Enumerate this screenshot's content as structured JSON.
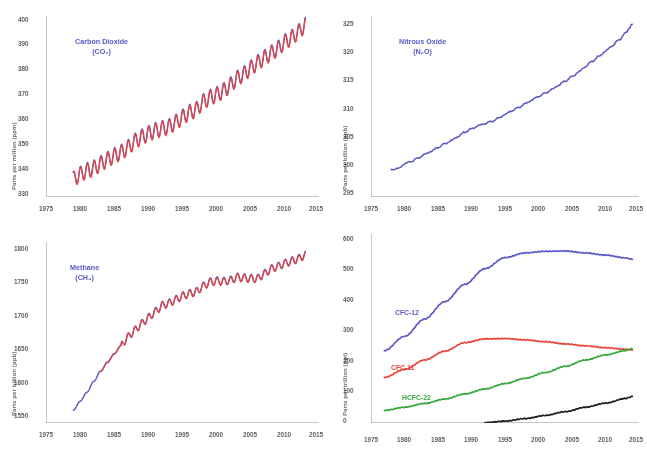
{
  "figure": {
    "panel_count": 4
  },
  "panels": {
    "co2": {
      "label": "Carbon Dioxide",
      "formula": "(CO₂)",
      "ylabel": "Parts per million (ppm)",
      "yticks": [
        "400",
        "390",
        "380",
        "370",
        "360",
        "350",
        "340",
        "330"
      ],
      "xticks": [
        "1975",
        "1980",
        "1985",
        "1990",
        "1995",
        "2000",
        "2005",
        "2010",
        "2015"
      ]
    },
    "n2o": {
      "label": "Nitrous Oxide",
      "formula": "(N₂O)",
      "ylabel": "Parts per billion (ppb)",
      "yticks": [
        "325",
        "320",
        "315",
        "310",
        "305",
        "300",
        "295"
      ],
      "xticks": [
        "1975",
        "1980",
        "1985",
        "1990",
        "1995",
        "2000",
        "2005",
        "2010",
        "2015"
      ]
    },
    "ch4": {
      "label": "Methane",
      "formula": "(CH₄)",
      "ylabel": "Parts per billion (ppb)",
      "yticks": [
        "1800",
        "1750",
        "1700",
        "1650",
        "1600",
        "1550"
      ],
      "xticks": [
        "1975",
        "1980",
        "1985",
        "1990",
        "1995",
        "2000",
        "2005",
        "2010",
        "2015"
      ]
    },
    "halocarbons": {
      "ylabel": "Parts per trillion (ppt)",
      "yticks": [
        "600",
        "500",
        "400",
        "300",
        "200",
        "100",
        "0"
      ],
      "xticks": [
        "1975",
        "1980",
        "1985",
        "1990",
        "1995",
        "2000",
        "2005",
        "2010",
        "2015"
      ],
      "series_labels": {
        "cfc12": "CFC-12",
        "cfc11": "CFC-11",
        "hcfc22": "HCFC-22",
        "hfc134a": "HFC-134a"
      }
    }
  },
  "colors": {
    "blue": "#5b58c8",
    "red": "#e8443a",
    "green": "#36a83a",
    "black": "#1d1d1d",
    "axis": "#9a9a9a",
    "tick_text": "#353535"
  },
  "chart_data": [
    {
      "type": "line",
      "id": "co2",
      "title": "Carbon Dioxide (CO2)",
      "xlabel": "",
      "ylabel": "Parts per million (ppm)",
      "xlim": [
        1975,
        2015
      ],
      "ylim": [
        330,
        400
      ],
      "grid": false,
      "legend": "none",
      "annotation": "Carbon Dioxide (CO₂)",
      "note": "Two overlapping traces (blue and red) showing monthly mean CO2 with a seasonal sawtooth cycle superimposed on a rising trend.",
      "series": [
        {
          "name": "CO2 (blue trace)",
          "color": "#5b58c8",
          "x": [
            1979,
            1980,
            1981,
            1982,
            1983,
            1984,
            1985,
            1986,
            1987,
            1988,
            1989,
            1990,
            1991,
            1992,
            1993,
            1994,
            1995,
            1996,
            1997,
            1998,
            1999,
            2000,
            2001,
            2002,
            2003,
            2004,
            2005,
            2006,
            2007,
            2008,
            2009,
            2010,
            2011,
            2012,
            2013
          ],
          "values": [
            336.8,
            338.7,
            340.1,
            341.1,
            342.8,
            344.4,
            345.9,
            347.2,
            349.0,
            351.5,
            353.1,
            354.4,
            355.6,
            356.4,
            357.1,
            358.8,
            360.8,
            362.6,
            363.7,
            366.7,
            368.4,
            369.5,
            371.0,
            373.2,
            375.8,
            377.5,
            379.8,
            381.9,
            383.8,
            385.6,
            387.4,
            389.9,
            391.6,
            393.8,
            396.5
          ]
        },
        {
          "name": "CO2 (red trace)",
          "color": "#e8443a",
          "x": [
            1979,
            1980,
            1981,
            1982,
            1983,
            1984,
            1985,
            1986,
            1987,
            1988,
            1989,
            1990,
            1991,
            1992,
            1993,
            1994,
            1995,
            1996,
            1997,
            1998,
            1999,
            2000,
            2001,
            2002,
            2003,
            2004,
            2005,
            2006,
            2007,
            2008,
            2009,
            2010,
            2011,
            2012,
            2013
          ],
          "values": [
            336.9,
            338.8,
            340.2,
            341.2,
            342.9,
            344.5,
            346.0,
            347.3,
            349.1,
            351.6,
            353.2,
            354.5,
            355.7,
            356.5,
            357.2,
            358.9,
            360.9,
            362.7,
            363.8,
            366.8,
            368.5,
            369.6,
            371.1,
            373.3,
            375.9,
            377.6,
            379.9,
            382.0,
            383.9,
            385.7,
            387.5,
            390.0,
            391.7,
            393.9,
            396.6
          ]
        }
      ],
      "seasonal_amplitude_ppm": 3.0
    },
    {
      "type": "line",
      "id": "n2o",
      "title": "Nitrous Oxide (N2O)",
      "xlabel": "",
      "ylabel": "Parts per billion (ppb)",
      "xlim": [
        1975,
        2015
      ],
      "ylim": [
        294,
        328
      ],
      "grid": false,
      "legend": "none",
      "annotation": "Nitrous Oxide (N₂O)",
      "series": [
        {
          "name": "N2O",
          "color": "#5b58c8",
          "x": [
            1978,
            1979,
            1980,
            1981,
            1982,
            1983,
            1984,
            1985,
            1986,
            1987,
            1988,
            1989,
            1990,
            1991,
            1992,
            1993,
            1994,
            1995,
            1996,
            1997,
            1998,
            1999,
            2000,
            2001,
            2002,
            2003,
            2004,
            2005,
            2006,
            2007,
            2008,
            2009,
            2010,
            2011,
            2012,
            2013,
            2014
          ],
          "values": [
            299.2,
            299.3,
            300.2,
            300.7,
            301.3,
            302.0,
            302.6,
            303.3,
            304.0,
            304.6,
            305.4,
            306.2,
            306.8,
            307.4,
            307.8,
            308.2,
            308.8,
            309.5,
            310.2,
            310.8,
            311.5,
            312.2,
            312.9,
            313.5,
            314.2,
            315.0,
            315.8,
            316.6,
            317.5,
            318.5,
            319.5,
            320.4,
            321.4,
            322.4,
            323.5,
            324.8,
            326.5
          ]
        }
      ]
    },
    {
      "type": "line",
      "id": "ch4",
      "title": "Methane (CH4)",
      "xlabel": "",
      "ylabel": "Parts per billion (ppb)",
      "xlim": [
        1975,
        2015
      ],
      "ylim": [
        1540,
        1840
      ],
      "grid": false,
      "legend": "none",
      "annotation": "Methane (CH₄)",
      "note": "Blue and red traces nearly coincide. Rapid rise through the 1980s, plateau from about 1999 to 2006, renewed rise after 2007.",
      "series": [
        {
          "name": "CH4 (blue trace)",
          "color": "#5b58c8",
          "x": [
            1979,
            1980,
            1981,
            1982,
            1983,
            1984,
            1985,
            1986,
            1987,
            1988,
            1989,
            1990,
            1991,
            1992,
            1993,
            1994,
            1995,
            1996,
            1997,
            1998,
            1999,
            2000,
            2001,
            2002,
            2003,
            2004,
            2005,
            2006,
            2007,
            2008,
            2009,
            2010,
            2011,
            2012,
            2013
          ],
          "values": [
            1560,
            1575,
            1590,
            1608,
            1625,
            1640,
            1654,
            1668,
            1682,
            1693,
            1704,
            1714,
            1724,
            1734,
            1738,
            1744,
            1750,
            1754,
            1757,
            1766,
            1773,
            1775,
            1774,
            1776,
            1781,
            1780,
            1779,
            1779,
            1787,
            1795,
            1799,
            1804,
            1808,
            1812,
            1818
          ]
        },
        {
          "name": "CH4 (red trace)",
          "color": "#e8443a",
          "x": [
            1983,
            1984,
            1985,
            1986,
            1987,
            1988,
            1989,
            1990,
            1991,
            1992,
            1993,
            1994,
            1995,
            1996,
            1997,
            1998,
            1999,
            2000,
            2001,
            2002,
            2003,
            2004,
            2005,
            2006,
            2007,
            2008,
            2009,
            2010,
            2011,
            2012,
            2013
          ],
          "values": [
            1626,
            1641,
            1655,
            1669,
            1683,
            1694,
            1705,
            1715,
            1725,
            1735,
            1739,
            1745,
            1751,
            1755,
            1758,
            1767,
            1774,
            1776,
            1775,
            1777,
            1782,
            1781,
            1780,
            1780,
            1788,
            1796,
            1800,
            1805,
            1809,
            1813,
            1819
          ]
        }
      ]
    },
    {
      "type": "line",
      "id": "halocarbons",
      "title": "Halocarbons",
      "xlabel": "",
      "ylabel": "Parts per trillion (ppt)",
      "xlim": [
        1975,
        2015
      ],
      "ylim": [
        0,
        600
      ],
      "grid": false,
      "legend": "in-plot labels",
      "series": [
        {
          "name": "CFC-12",
          "color": "#5b58c8",
          "x": [
            1977,
            1980,
            1983,
            1986,
            1989,
            1992,
            1995,
            1998,
            2001,
            2004,
            2007,
            2010,
            2013,
            2014
          ],
          "values": [
            230,
            275,
            330,
            385,
            440,
            490,
            525,
            540,
            545,
            546,
            540,
            533,
            524,
            520
          ]
        },
        {
          "name": "CFC-11",
          "color": "#e8443a",
          "x": [
            1977,
            1980,
            1983,
            1986,
            1989,
            1992,
            1995,
            1998,
            2001,
            2004,
            2007,
            2010,
            2013,
            2014
          ],
          "values": [
            145,
            170,
            200,
            228,
            255,
            267,
            268,
            264,
            258,
            251,
            245,
            239,
            234,
            232
          ]
        },
        {
          "name": "HCFC-22",
          "color": "#36a83a",
          "x": [
            1977,
            1980,
            1983,
            1986,
            1989,
            1992,
            1995,
            1998,
            2001,
            2004,
            2007,
            2010,
            2013,
            2014
          ],
          "values": [
            40,
            50,
            62,
            76,
            92,
            108,
            125,
            142,
            160,
            180,
            200,
            216,
            230,
            236
          ]
        },
        {
          "name": "HFC-134a",
          "color": "#1d1d1d",
          "x": [
            1992,
            1995,
            1998,
            2001,
            2004,
            2007,
            2010,
            2013,
            2014
          ],
          "values": [
            1,
            6,
            14,
            24,
            36,
            50,
            63,
            78,
            84
          ]
        }
      ]
    }
  ]
}
